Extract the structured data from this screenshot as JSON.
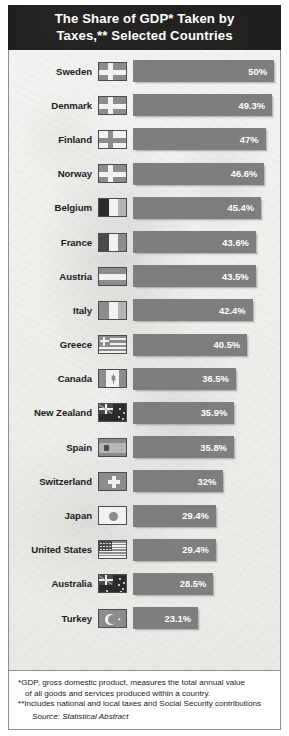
{
  "title": {
    "line1": "The Share of GDP* Taken by",
    "line2": "Taxes,** Selected Countries",
    "full": "The Share of GDP* Taken by Taxes,** Selected Countries"
  },
  "footnotes": {
    "note1_line1": "*GDP, gross domestic product, measures the total annual value",
    "note1_line2": "of all goods and services produced within a country.",
    "note2": "**Includes national and local taxes and Social Security contributions",
    "source": "Source: Statistical Abstract"
  },
  "colors": {
    "header_background": "#1d1b1a",
    "header_text": "#ffffff",
    "chart_background": "#ededeb",
    "bar_fill": "#7e7e7e",
    "bar_label": "#ffffff",
    "country_label": "#1b1b1b",
    "border": "#8d8d8b"
  },
  "chart_data": {
    "type": "bar",
    "title": "The Share of GDP* Taken by Taxes,** Selected Countries",
    "xlabel": "",
    "ylabel": "",
    "orientation": "horizontal",
    "grid": false,
    "legend": false,
    "xlim": [
      0,
      50
    ],
    "units": "percent of GDP",
    "categories": [
      "Sweden",
      "Denmark",
      "Finland",
      "Norway",
      "Belgium",
      "France",
      "Austria",
      "Italy",
      "Greece",
      "Canada",
      "New Zealand",
      "Spain",
      "Switzerland",
      "Japan",
      "United States",
      "Australia",
      "Turkey"
    ],
    "values": [
      50,
      49.3,
      47,
      46.6,
      45.4,
      43.6,
      43.5,
      42.4,
      40.5,
      36.5,
      35.9,
      35.8,
      32,
      29.4,
      29.4,
      28.5,
      23.1
    ],
    "value_labels": [
      "50%",
      "49.3%",
      "47%",
      "46.6%",
      "45.4%",
      "43.6%",
      "43.5%",
      "42.4%",
      "40.5%",
      "36.5%",
      "35.9%",
      "35.8%",
      "32%",
      "29.4%",
      "29.4%",
      "28.5%",
      "23.1%"
    ],
    "flags": [
      "sweden-flag",
      "denmark-flag",
      "finland-flag",
      "norway-flag",
      "belgium-flag",
      "france-flag",
      "austria-flag",
      "italy-flag",
      "greece-flag",
      "canada-flag",
      "new-zealand-flag",
      "spain-flag",
      "switzerland-flag",
      "japan-flag",
      "united-states-flag",
      "australia-flag",
      "turkey-flag"
    ]
  }
}
